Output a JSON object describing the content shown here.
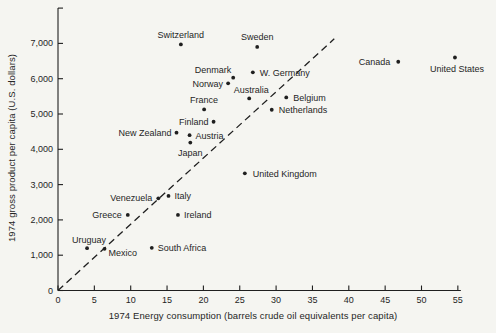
{
  "figure": {
    "background": "#f5f5f1",
    "ink": "#1f1f1f"
  },
  "chart_data": {
    "type": "scatter",
    "title": "",
    "xlabel": "1974 Energy consumption (barrels crude oil equivalents per capita)",
    "ylabel": "1974 gross product per capita (U.S. dollars)",
    "xlim": [
      0,
      55
    ],
    "ylim": [
      0,
      8000
    ],
    "grid": false,
    "legend": "none",
    "x_ticks": [
      {
        "value": 0,
        "label": "0"
      },
      {
        "value": 5,
        "label": "5"
      },
      {
        "value": 10,
        "label": "10"
      },
      {
        "value": 15,
        "label": "15"
      },
      {
        "value": 20,
        "label": "20"
      },
      {
        "value": 25,
        "label": "25"
      },
      {
        "value": 30,
        "label": "30"
      },
      {
        "value": 35,
        "label": "35"
      },
      {
        "value": 40,
        "label": "40"
      },
      {
        "value": 45,
        "label": "45"
      },
      {
        "value": 50,
        "label": "50"
      },
      {
        "value": 55,
        "label": "55"
      }
    ],
    "y_ticks": [
      {
        "value": 0,
        "label": "0"
      },
      {
        "value": 1000,
        "label": "1,000"
      },
      {
        "value": 2000,
        "label": "2,000"
      },
      {
        "value": 3000,
        "label": "3,000"
      },
      {
        "value": 4000,
        "label": "4,000"
      },
      {
        "value": 5000,
        "label": "5,000"
      },
      {
        "value": 6000,
        "label": "6,000"
      },
      {
        "value": 7000,
        "label": "7,000"
      },
      {
        "value": 8000,
        "label": ""
      }
    ],
    "reference_line": {
      "style": "dashed",
      "from_x": 0,
      "from_y": 0,
      "to_x": 38,
      "to_y": 7130
    },
    "points": [
      {
        "name": "Switzerland",
        "x": 16.9,
        "y": 6970,
        "anchor": "middle",
        "dx": 0,
        "dy": -6
      },
      {
        "name": "Sweden",
        "x": 27.4,
        "y": 6900,
        "anchor": "middle",
        "dx": 0,
        "dy": -7
      },
      {
        "name": "Canada",
        "x": 46.8,
        "y": 6480,
        "anchor": "end",
        "dx": -8,
        "dy": 3.5
      },
      {
        "name": "United States",
        "x": 54.6,
        "y": 6600,
        "anchor": "middle",
        "dx": 2,
        "dy": 14
      },
      {
        "name": "W. Germany",
        "x": 26.8,
        "y": 6180,
        "anchor": "start",
        "dx": 7,
        "dy": 3.5
      },
      {
        "name": "Denmark",
        "x": 24.1,
        "y": 6030,
        "anchor": "end",
        "dx": -2,
        "dy": -5
      },
      {
        "name": "Norway",
        "x": 23.4,
        "y": 5870,
        "anchor": "end",
        "dx": -5,
        "dy": 3.5
      },
      {
        "name": "Belgium",
        "x": 31.4,
        "y": 5470,
        "anchor": "start",
        "dx": 7,
        "dy": 3.5
      },
      {
        "name": "Australia",
        "x": 26.3,
        "y": 5440,
        "anchor": "middle",
        "dx": 2,
        "dy": -5
      },
      {
        "name": "Netherlands",
        "x": 29.4,
        "y": 5120,
        "anchor": "start",
        "dx": 7,
        "dy": 3.5
      },
      {
        "name": "France",
        "x": 20.1,
        "y": 5130,
        "anchor": "middle",
        "dx": 0,
        "dy": -6
      },
      {
        "name": "Finland",
        "x": 21.4,
        "y": 4780,
        "anchor": "end",
        "dx": -5,
        "dy": 3.5
      },
      {
        "name": "New Zealand",
        "x": 16.3,
        "y": 4470,
        "anchor": "end",
        "dx": -5,
        "dy": 3.5
      },
      {
        "name": "Austria",
        "x": 18.1,
        "y": 4400,
        "anchor": "start",
        "dx": 6,
        "dy": 3.5
      },
      {
        "name": "Japan",
        "x": 18.2,
        "y": 4190,
        "anchor": "middle",
        "dx": 0,
        "dy": 13
      },
      {
        "name": "United Kingdom",
        "x": 25.7,
        "y": 3320,
        "anchor": "start",
        "dx": 8,
        "dy": 3.5
      },
      {
        "name": "Italy",
        "x": 15.2,
        "y": 2680,
        "anchor": "start",
        "dx": 6,
        "dy": 3.5
      },
      {
        "name": "Venezuela",
        "x": 13.8,
        "y": 2610,
        "anchor": "end",
        "dx": -6,
        "dy": 2.5
      },
      {
        "name": "Greece",
        "x": 9.6,
        "y": 2140,
        "anchor": "end",
        "dx": -6,
        "dy": 3.5
      },
      {
        "name": "Ireland",
        "x": 16.5,
        "y": 2140,
        "anchor": "start",
        "dx": 6,
        "dy": 3.5
      },
      {
        "name": "South Africa",
        "x": 12.9,
        "y": 1210,
        "anchor": "start",
        "dx": 6,
        "dy": 3.5
      },
      {
        "name": "Uruguay",
        "x": 4.0,
        "y": 1200,
        "anchor": "middle",
        "dx": 2,
        "dy": -5.5
      },
      {
        "name": "Mexico",
        "x": 6.4,
        "y": 1180,
        "anchor": "start",
        "dx": 4,
        "dy": 7
      }
    ]
  }
}
